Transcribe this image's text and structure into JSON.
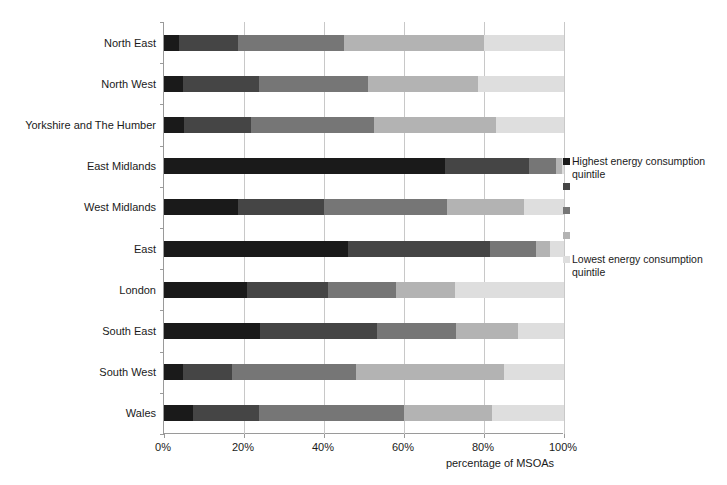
{
  "chart_data": {
    "type": "bar",
    "orientation": "horizontal",
    "stacked": true,
    "normalized": true,
    "title": "",
    "xlabel": "percentage of MSOAs",
    "ylabel": "",
    "xlim": [
      0,
      100
    ],
    "grid": true,
    "legend_position": "right",
    "categories": [
      "North East",
      "North West",
      "Yorkshire and The Humber",
      "East Midlands",
      "West Midlands",
      "East",
      "London",
      "South East",
      "South West",
      "Wales"
    ],
    "xticks": [
      "0%",
      "20%",
      "40%",
      "60%",
      "80%",
      "100%"
    ],
    "xtick_values": [
      0,
      20,
      40,
      60,
      80,
      100
    ],
    "series": [
      {
        "name": "Highest energy consumption quintile",
        "legend_label": "Highest energy consumption quintile",
        "color": "#1a1a1a",
        "values": [
          3.8,
          4.8,
          5.0,
          70.3,
          18.4,
          46.0,
          20.8,
          24.0,
          4.8,
          7.3
        ]
      },
      {
        "name": "Quintile 2",
        "legend_label": "",
        "color": "#454545",
        "values": [
          14.7,
          18.9,
          16.8,
          20.9,
          21.6,
          35.5,
          20.2,
          29.2,
          12.2,
          16.5
        ]
      },
      {
        "name": "Quintile 3",
        "legend_label": "",
        "color": "#767676",
        "values": [
          26.5,
          27.3,
          30.7,
          6.8,
          30.7,
          11.5,
          17.0,
          19.8,
          31.0,
          36.2
        ]
      },
      {
        "name": "Quintile 4",
        "legend_label": "",
        "color": "#b3b3b3",
        "values": [
          35.0,
          27.5,
          30.5,
          1.5,
          19.3,
          3.5,
          14.8,
          15.5,
          37.0,
          22.0
        ]
      },
      {
        "name": "Lowest energy consumption quintile",
        "legend_label": "Lowest energy consumption quintile",
        "color": "#dedede",
        "values": [
          20.0,
          21.5,
          17.0,
          0.5,
          10.0,
          3.5,
          27.2,
          11.5,
          15.0,
          18.0
        ]
      }
    ]
  },
  "axis": {
    "x_title": "percentage of MSOAs",
    "x_tick_labels": [
      "0%",
      "20%",
      "40%",
      "60%",
      "80%",
      "100%"
    ]
  },
  "legend": {
    "items": [
      {
        "label": "Highest energy consumption quintile",
        "color": "#1a1a1a"
      },
      {
        "label": "",
        "color": "#454545"
      },
      {
        "label": "",
        "color": "#767676"
      },
      {
        "label": "",
        "color": "#b3b3b3"
      },
      {
        "label": "Lowest energy consumption quintile",
        "color": "#dedede"
      }
    ]
  }
}
